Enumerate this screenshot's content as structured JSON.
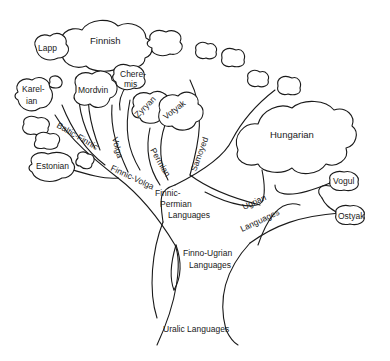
{
  "diagram": {
    "root": "Uralic Languages",
    "branches": {
      "finno_ugrian": "Finno-Ugrian Languages",
      "finnic_permian": {
        "line1": "Finnic-",
        "line2": "Permian",
        "line3": "Languages"
      },
      "ugrian": {
        "line1": "Ugrian",
        "line2": "Languages"
      },
      "samoyed": "Samoyed",
      "finnic_volga": "Finnic-Volga",
      "permian": "Permian",
      "volga": "Volga",
      "baltic_finnic": "Baltic-Finnic"
    },
    "leaves": {
      "finnish": "Finnish",
      "lapp": "Lapp",
      "karelian": {
        "line1": "Karel-",
        "line2": "ian"
      },
      "estonian": "Estonian",
      "mordvin": "Mordvin",
      "cheremis": {
        "line1": "Chere-",
        "line2": "mis"
      },
      "zyryan": "Zyryan",
      "votyak": "Votyak",
      "hungarian": "Hungarian",
      "vogul": "Vogul",
      "ostyak": "Ostyak"
    },
    "finno_ugrian_label": {
      "line1": "Finno-Ugrian",
      "line2": "Languages"
    },
    "colors": {
      "stroke": "#1a1a1a",
      "background": "#ffffff"
    }
  }
}
